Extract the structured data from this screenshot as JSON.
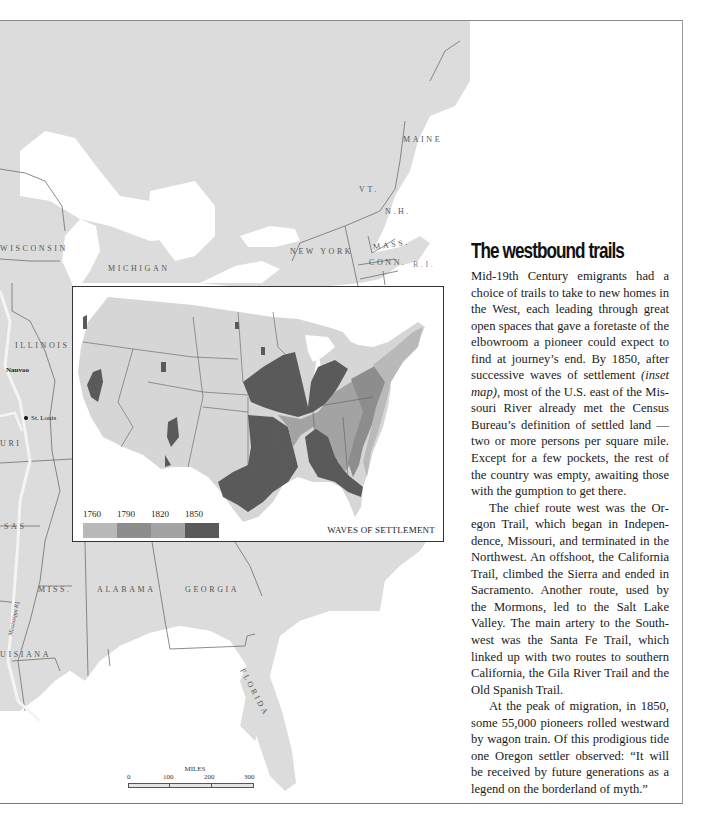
{
  "map": {
    "state_labels": [
      {
        "id": "wisconsin",
        "text": "WISCONSIN"
      },
      {
        "id": "michigan",
        "text": "MICHIGAN"
      },
      {
        "id": "new-york",
        "text": "NEW YORK"
      },
      {
        "id": "maine",
        "text": "MAINE"
      },
      {
        "id": "vt",
        "text": "VT."
      },
      {
        "id": "nh",
        "text": "N.H."
      },
      {
        "id": "mass",
        "text": "MASS."
      },
      {
        "id": "conn",
        "text": "CONN."
      },
      {
        "id": "ri",
        "text": "R.I."
      },
      {
        "id": "illinois",
        "text": "ILLINOIS"
      },
      {
        "id": "missouri",
        "text": "URI"
      },
      {
        "id": "arkansas",
        "text": "SAS"
      },
      {
        "id": "miss",
        "text": "MISS."
      },
      {
        "id": "alabama",
        "text": "ALABAMA"
      },
      {
        "id": "georgia",
        "text": "GEORGIA"
      },
      {
        "id": "louisiana",
        "text": "UISIANA"
      },
      {
        "id": "florida",
        "text": "FLORIDA"
      }
    ],
    "cities": [
      {
        "id": "nauvoo",
        "text": "Nauvoo"
      },
      {
        "id": "st-louis",
        "text": "St. Louis"
      }
    ],
    "river_label": "Mississippi R.",
    "scale": {
      "title": "MILES",
      "ticks": [
        "0",
        "100",
        "200",
        "300"
      ]
    },
    "colors": {
      "land": "#dcdcdc",
      "water": "#ffffff",
      "border": "#6e6e6e"
    }
  },
  "inset": {
    "title": "WAVES OF SETTLEMENT",
    "legend": [
      {
        "year": "1760",
        "color": "#b9b9b9"
      },
      {
        "year": "1790",
        "color": "#8d8d8d"
      },
      {
        "year": "1820",
        "color": "#a3a3a3"
      },
      {
        "year": "1850",
        "color": "#5a5a5a"
      }
    ],
    "unsettled_color": "#d6d6d6"
  },
  "article": {
    "headline": "The westbound trails",
    "paragraphs": [
      {
        "before": "Mid-19th Century emigrants had a choice of trails to take to new homes in the West, each leading through great open spaces that gave a foretaste of the elbowroom a pioneer could expect to find at journey’s end. By 1850, after successive waves of settlement ",
        "italic": "(inset map),",
        "after": " most of the U.S. east of the Mis­souri River already met the Census Bu­reau’s definition of settled land — two or more persons per square mile. Except for a few pockets, the rest of the coun­try was empty, awaiting those with the gumption to get there."
      },
      {
        "text": "The chief route west was the Or­egon Trail, which began in Indepen­dence, Missouri, and terminated in the Northwest. An offshoot, the California Trail, climbed the Sierra and ended in Sacramento. Another route, used by the Mormons, led to the Salt Lake Valley. The main artery to the South­west was the Santa Fe Trail, which linked up with two routes to southern California, the Gila River Trail and the Old Spanish Trail."
      },
      {
        "text": "At the peak of migration, in 1850, some 55,000 pioneers rolled westward by wagon train. Of this prodigious tide one Oregon settler observed: “It will be received by future generations as a legend on the borderland of myth.”"
      }
    ]
  }
}
